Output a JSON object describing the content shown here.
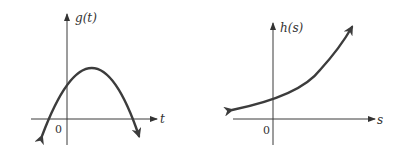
{
  "graphs": [
    {
      "id": "g",
      "y_label": "g(t)",
      "x_label": "t",
      "origin_label": "0",
      "shape": "downward parabola, positive y-intercept, vertex to the right of the y-axis, two x-intercepts (one negative, one positive), both ends point downward"
    },
    {
      "id": "h",
      "y_label": "h(s)",
      "x_label": "s",
      "origin_label": "0",
      "shape": "increasing exponential-like curve, positive y-intercept, approaches x-axis asymptotically to the left, rises steeply to the right"
    }
  ],
  "colors": {
    "ink": "#3c3c3c",
    "background": "#ffffff"
  }
}
